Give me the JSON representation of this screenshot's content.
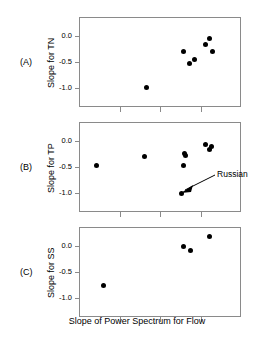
{
  "figure": {
    "xlabel": "Slope of Power Spectrum for Flow",
    "panel_letters": [
      "(A)",
      "(B)",
      "(C)"
    ]
  },
  "chart_data": [
    {
      "type": "scatter",
      "panel": "(A)",
      "title": "",
      "xlabel": "Slope of Power Spectrum for Flow",
      "ylabel": "Slope for TN",
      "xlim": [
        0,
        4
      ],
      "ylim": [
        -1.35,
        0.35
      ],
      "yticks": [
        0.0,
        -0.5,
        -1.0
      ],
      "ytick_labels": [
        "0.0",
        "-0.5",
        "-1.0"
      ],
      "xticks": [
        0,
        1,
        2,
        3,
        4
      ],
      "xtick_labels": [
        "",
        "",
        "",
        "",
        ""
      ],
      "grid": false,
      "legend": null,
      "points": [
        {
          "x": 1.66,
          "y": -0.99
        },
        {
          "x": 2.57,
          "y": -0.3
        },
        {
          "x": 2.73,
          "y": -0.53
        },
        {
          "x": 2.84,
          "y": -0.45
        },
        {
          "x": 3.21,
          "y": -0.05
        },
        {
          "x": 3.12,
          "y": -0.17
        },
        {
          "x": 3.3,
          "y": -0.31
        }
      ]
    },
    {
      "type": "scatter",
      "panel": "(B)",
      "title": "",
      "xlabel": "Slope of Power Spectrum for Flow",
      "ylabel": "Slope for TP",
      "xlim": [
        0,
        4
      ],
      "ylim": [
        -1.35,
        0.35
      ],
      "yticks": [
        0.0,
        -0.5,
        -1.0
      ],
      "ytick_labels": [
        "0.0",
        "-0.5",
        "-1.0"
      ],
      "xticks": [
        0,
        1,
        2,
        3,
        4
      ],
      "xtick_labels": [
        "",
        "",
        "",
        "",
        ""
      ],
      "grid": false,
      "legend": null,
      "points": [
        {
          "x": 0.44,
          "y": -0.48
        },
        {
          "x": 1.62,
          "y": -0.31
        },
        {
          "x": 2.6,
          "y": -0.24
        },
        {
          "x": 2.64,
          "y": -0.28
        },
        {
          "x": 2.59,
          "y": -0.47
        },
        {
          "x": 3.13,
          "y": -0.07
        },
        {
          "x": 3.27,
          "y": -0.12
        },
        {
          "x": 3.22,
          "y": -0.17
        },
        {
          "x": 2.52,
          "y": -1.0,
          "label": "Russian"
        }
      ],
      "annotations": [
        {
          "text": "Russian",
          "target_x": 2.52,
          "target_y": -1.0
        }
      ]
    },
    {
      "type": "scatter",
      "panel": "(C)",
      "title": "",
      "xlabel": "Slope of Power Spectrum for Flow",
      "ylabel": "Slope for SS",
      "xlim": [
        0,
        4
      ],
      "ylim": [
        -1.35,
        0.35
      ],
      "yticks": [
        0.0,
        -0.5,
        -1.0
      ],
      "ytick_labels": [
        "0.0",
        "-0.5",
        "-1.0"
      ],
      "xticks": [
        0,
        1,
        2,
        3,
        4
      ],
      "xtick_labels": [
        "",
        "",
        "",
        "",
        ""
      ],
      "grid": false,
      "legend": null,
      "points": [
        {
          "x": 0.6,
          "y": -0.75
        },
        {
          "x": 2.59,
          "y": -0.01
        },
        {
          "x": 2.76,
          "y": -0.1
        },
        {
          "x": 3.22,
          "y": 0.17
        }
      ]
    }
  ]
}
